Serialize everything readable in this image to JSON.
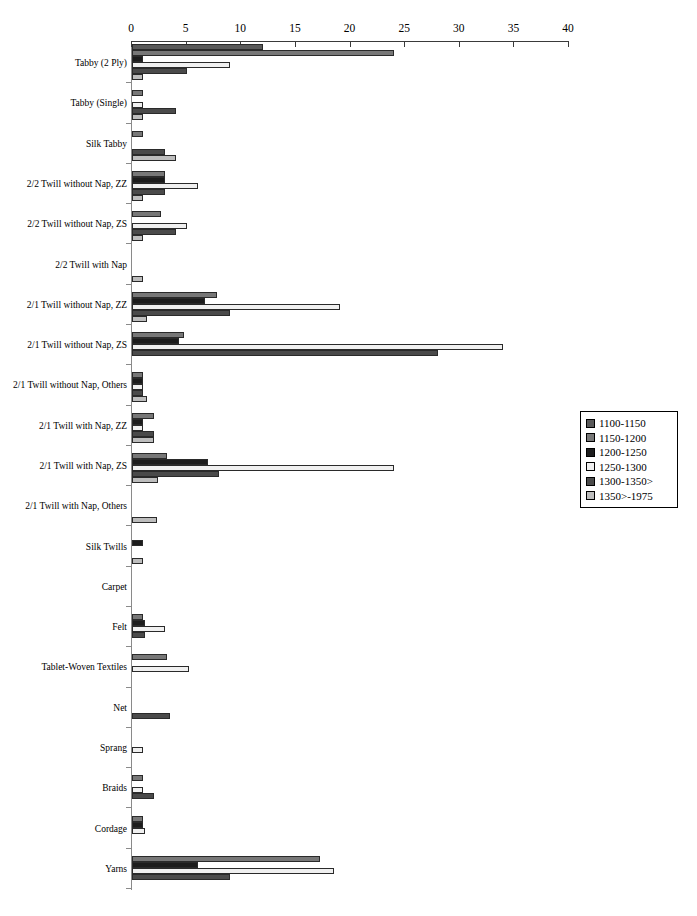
{
  "chart_data": {
    "type": "bar",
    "orientation": "horizontal",
    "title": "",
    "subtitle": "",
    "xlabel": "",
    "ylabel": "",
    "xlim": [
      0,
      40
    ],
    "xticks": [
      0,
      5,
      10,
      15,
      20,
      25,
      30,
      35,
      40
    ],
    "xtick_labels": [
      "0",
      "5",
      "10",
      "15",
      "20",
      "25",
      "30",
      "35",
      "40"
    ],
    "grid": false,
    "legend_position": "right",
    "legend_entries": [
      "1100-1150",
      "1150-1200",
      "1200-1250",
      "1250-1300",
      "1300-1350>",
      "1350>-1975"
    ],
    "series_colors": [
      "#595959",
      "#777777",
      "#1c1c1c",
      "#f0f0f0",
      "#4a4a4a",
      "#bdbdbd"
    ],
    "categories": [
      "Tabby (2 Ply)",
      "Tabby (Single)",
      "Silk Tabby",
      "2/2 Twill without Nap, ZZ",
      "2/2 Twill without Nap, ZS",
      "2/2 Twill with Nap",
      "2/1 Twill without Nap, ZZ",
      "2/1 Twill without Nap, ZS",
      "2/1 Twill without Nap, Others",
      "2/1 Twill with Nap, ZZ",
      "2/1 Twill with Nap, ZS",
      "2/1 Twill with Nap, Others",
      "Silk Twills",
      "Carpet",
      "Felt",
      "Tablet-Woven Textiles",
      "Net",
      "Sprang",
      "Braids",
      "Cordage",
      "Yarns"
    ],
    "series": [
      {
        "name": "1100-1150",
        "color": "#595959",
        "values": [
          12.0,
          0,
          0,
          0,
          0,
          0,
          0,
          0,
          0,
          0,
          0,
          0,
          0,
          0,
          0,
          0,
          0,
          0,
          0,
          0,
          0
        ]
      },
      {
        "name": "1150-1200",
        "color": "#777777",
        "values": [
          24.0,
          1.0,
          1.0,
          3.0,
          2.7,
          0,
          7.8,
          4.8,
          1.0,
          2.0,
          3.2,
          0,
          0,
          0,
          1.0,
          3.2,
          0,
          0,
          1.0,
          1.0,
          17.2
        ]
      },
      {
        "name": "1200-1250",
        "color": "#1c1c1c",
        "values": [
          1.0,
          0,
          0,
          3.0,
          0,
          0,
          6.7,
          4.3,
          1.0,
          1.0,
          7.0,
          0,
          1.0,
          0,
          1.2,
          0,
          0,
          0,
          0,
          1.0,
          6.0
        ]
      },
      {
        "name": "1250-1300",
        "color": "#f0f0f0",
        "values": [
          9.0,
          1.0,
          0,
          6.0,
          5.0,
          0,
          19.0,
          34.0,
          1.0,
          1.0,
          24.0,
          0,
          0,
          0,
          3.0,
          5.2,
          0,
          1.0,
          1.0,
          1.2,
          18.5
        ]
      },
      {
        "name": "1300-1350>",
        "color": "#4a4a4a",
        "values": [
          5.0,
          4.0,
          3.0,
          3.0,
          4.0,
          0,
          9.0,
          28.0,
          1.0,
          2.0,
          8.0,
          0,
          0,
          0,
          1.2,
          0,
          3.5,
          0,
          2.0,
          0,
          9.0
        ]
      },
      {
        "name": "1350>-1975",
        "color": "#bdbdbd",
        "values": [
          1.0,
          1.0,
          4.0,
          1.0,
          1.0,
          1.0,
          1.4,
          0,
          1.4,
          2.0,
          2.4,
          2.3,
          1.0,
          0,
          0,
          0,
          0,
          0,
          0,
          0,
          0
        ]
      }
    ]
  }
}
